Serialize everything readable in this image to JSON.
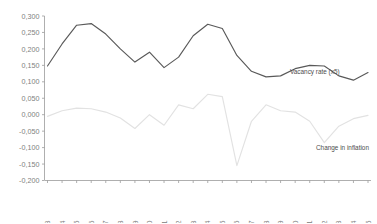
{
  "chart_data": {
    "type": "line",
    "title": "",
    "xlabel": "",
    "ylabel": "",
    "ylim": [
      -0.2,
      0.3
    ],
    "xlim": [
      1963,
      1985
    ],
    "grid": false,
    "legend_position": "inline-annotation",
    "decimal_separator": ",",
    "ytick_labels": [
      "0,300",
      "0,250",
      "0,200",
      "0,150",
      "0,100",
      "0,050",
      "0,000",
      "-0,050",
      "-0,100",
      "-0,150",
      "-0,200"
    ],
    "ytick_values": [
      0.3,
      0.25,
      0.2,
      0.15,
      0.1,
      0.05,
      0.0,
      -0.05,
      -0.1,
      -0.15,
      -0.2
    ],
    "categories": [
      1963,
      1964,
      1965,
      1966,
      1967,
      1968,
      1969,
      1970,
      1971,
      1972,
      1973,
      1974,
      1975,
      1976,
      1977,
      1978,
      1979,
      1980,
      1981,
      1982,
      1983,
      1984,
      1985
    ],
    "xtick_labels": [
      "1963",
      "1964",
      "1965",
      "1966",
      "1967",
      "1968",
      "1969",
      "1970",
      "1971",
      "1972",
      "1973",
      "1974",
      "1975",
      "1976",
      "1977",
      "1978",
      "1979",
      "1980",
      "1981",
      "1982",
      "1983",
      "1984",
      "1985"
    ],
    "series": [
      {
        "name": "Vacancy rate (x5)",
        "color": "#595959",
        "annotation": "Vacancy rate (x5)",
        "values": [
          0.148,
          0.215,
          0.272,
          0.277,
          0.245,
          0.2,
          0.16,
          0.19,
          0.143,
          0.175,
          0.24,
          0.275,
          0.262,
          0.18,
          0.132,
          0.115,
          0.118,
          0.14,
          0.15,
          0.148,
          0.118,
          0.105,
          0.128
        ]
      },
      {
        "name": "Change in inflation",
        "color": "#e2e2e2",
        "annotation": "Change in inflation",
        "values": [
          -0.005,
          0.012,
          0.02,
          0.018,
          0.008,
          -0.01,
          -0.042,
          0.0,
          -0.032,
          0.03,
          0.018,
          0.062,
          0.055,
          -0.155,
          -0.02,
          0.03,
          0.012,
          0.008,
          -0.02,
          -0.085,
          -0.035,
          -0.012,
          -0.002
        ]
      }
    ]
  },
  "annotations": {
    "vacancy_label": "Vacancy rate (x5)",
    "inflation_label": "Change in inflation"
  }
}
